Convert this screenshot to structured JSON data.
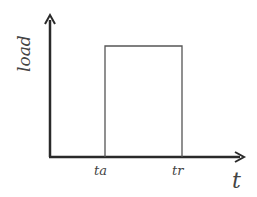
{
  "diagram": {
    "type": "step-load-graph",
    "y_axis_label": "load",
    "x_axis_label": "t",
    "tick_labels": [
      "ta",
      "tr"
    ],
    "pulse": {
      "start": "ta",
      "end": "tr",
      "description": "rectangular load pulse between ta and tr"
    }
  }
}
